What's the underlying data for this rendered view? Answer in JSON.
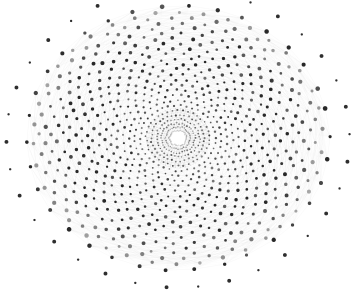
{
  "figure": {
    "background_color": "#ffffff",
    "width": 355,
    "height": 303,
    "alt_text": "Dense circular network graph drawn as concentric rings of nodes connected by many pale gray edges, forming a hairball with a bright hub at the center and isolated dark nodes around the outer rim."
  },
  "chart_data": {
    "type": "scatter",
    "subtitle": "",
    "xlabel": "",
    "ylabel": "",
    "grid": false,
    "legend_position": "none",
    "axes_visible": false,
    "tick_labels": [],
    "annotations": [],
    "layout": "concentric-radial",
    "center": {
      "x": 178,
      "y": 138
    },
    "radius_x": 156,
    "radius_y": 136,
    "rotation_per_ring_deg": 4.6,
    "ring_count": 26,
    "spokes_per_ring": 38,
    "hub": {
      "x": 178,
      "y": 138,
      "radius": 3.1,
      "color": "#ffffff",
      "halo_color": "#9a9a9a"
    },
    "edge_color": "#808080",
    "edge_opacity": 0.12,
    "edge_width": 0.4,
    "node_color": "#2e2e2e",
    "rim_node_count": 34,
    "rim_node_radius_scale": 1.1,
    "rim_node_size": 1.9,
    "gear_teeth": 38,
    "gear_inner_radius": 9,
    "gear_outer_radius": 30,
    "density_band_peak_fraction": 0.55,
    "rings": [
      {
        "index": 0,
        "radius_fraction": 0.055,
        "nodes": 38,
        "node_size": 0.7,
        "darkness": 0.55
      },
      {
        "index": 1,
        "radius_fraction": 0.08,
        "nodes": 38,
        "node_size": 0.7,
        "darkness": 0.6
      },
      {
        "index": 2,
        "radius_fraction": 0.108,
        "nodes": 38,
        "node_size": 0.8,
        "darkness": 0.66
      },
      {
        "index": 3,
        "radius_fraction": 0.138,
        "nodes": 38,
        "node_size": 0.8,
        "darkness": 0.72
      },
      {
        "index": 4,
        "radius_fraction": 0.17,
        "nodes": 38,
        "node_size": 0.9,
        "darkness": 0.76
      },
      {
        "index": 5,
        "radius_fraction": 0.204,
        "nodes": 38,
        "node_size": 0.9,
        "darkness": 0.78
      },
      {
        "index": 6,
        "radius_fraction": 0.24,
        "nodes": 38,
        "node_size": 1.0,
        "darkness": 0.8
      },
      {
        "index": 7,
        "radius_fraction": 0.278,
        "nodes": 38,
        "node_size": 1.0,
        "darkness": 0.82
      },
      {
        "index": 8,
        "radius_fraction": 0.316,
        "nodes": 38,
        "node_size": 1.1,
        "darkness": 0.84
      },
      {
        "index": 9,
        "radius_fraction": 0.354,
        "nodes": 38,
        "node_size": 1.1,
        "darkness": 0.86
      },
      {
        "index": 10,
        "radius_fraction": 0.392,
        "nodes": 38,
        "node_size": 1.2,
        "darkness": 0.88
      },
      {
        "index": 11,
        "radius_fraction": 0.43,
        "nodes": 38,
        "node_size": 1.2,
        "darkness": 0.9
      },
      {
        "index": 12,
        "radius_fraction": 0.468,
        "nodes": 38,
        "node_size": 1.3,
        "darkness": 0.92
      },
      {
        "index": 13,
        "radius_fraction": 0.506,
        "nodes": 38,
        "node_size": 1.3,
        "darkness": 0.94
      },
      {
        "index": 14,
        "radius_fraction": 0.544,
        "nodes": 38,
        "node_size": 1.4,
        "darkness": 0.96
      },
      {
        "index": 15,
        "radius_fraction": 0.582,
        "nodes": 38,
        "node_size": 1.4,
        "darkness": 0.97
      },
      {
        "index": 16,
        "radius_fraction": 0.62,
        "nodes": 38,
        "node_size": 1.5,
        "darkness": 0.98
      },
      {
        "index": 17,
        "radius_fraction": 0.658,
        "nodes": 38,
        "node_size": 1.5,
        "darkness": 0.97
      },
      {
        "index": 18,
        "radius_fraction": 0.696,
        "nodes": 38,
        "node_size": 1.5,
        "darkness": 0.95
      },
      {
        "index": 19,
        "radius_fraction": 0.734,
        "nodes": 38,
        "node_size": 1.6,
        "darkness": 0.92
      },
      {
        "index": 20,
        "radius_fraction": 0.772,
        "nodes": 38,
        "node_size": 1.6,
        "darkness": 0.88
      },
      {
        "index": 21,
        "radius_fraction": 0.81,
        "nodes": 38,
        "node_size": 1.6,
        "darkness": 0.82
      },
      {
        "index": 22,
        "radius_fraction": 0.848,
        "nodes": 38,
        "node_size": 1.7,
        "darkness": 0.76
      },
      {
        "index": 23,
        "radius_fraction": 0.886,
        "nodes": 38,
        "node_size": 1.7,
        "darkness": 0.68
      },
      {
        "index": 24,
        "radius_fraction": 0.928,
        "nodes": 38,
        "node_size": 1.8,
        "darkness": 0.6
      },
      {
        "index": 25,
        "radius_fraction": 0.972,
        "nodes": 34,
        "node_size": 1.9,
        "darkness": 0.95
      }
    ],
    "x": [],
    "values": []
  }
}
